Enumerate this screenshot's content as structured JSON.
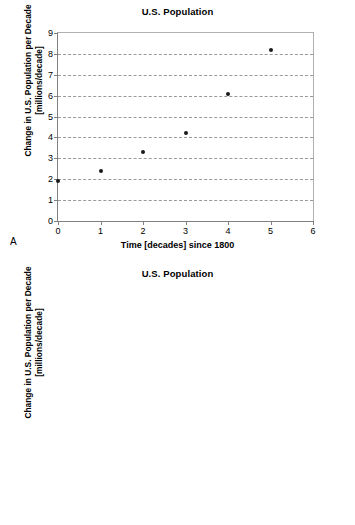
{
  "panels": [
    {
      "letter": "A",
      "title": "U.S. Population",
      "xlabel": "Time [decades] since 1800",
      "ylabel_line1": "Change in U.S. Population per Decade",
      "ylabel_line2": "[millions/decade]"
    },
    {
      "letter": "B",
      "title": "U.S. Population",
      "xlabel": "U.S. Population [millions]",
      "ylabel_line1": "Change in U.S. Population per Decade",
      "ylabel_line2": "[millions/decade]"
    }
  ],
  "chart_data": [
    {
      "type": "scatter",
      "panel": "A",
      "title": "U.S. Population",
      "xlabel": "Time [decades] since 1800",
      "ylabel": "Change in U.S. Population per Decade [millions/decade]",
      "xlim": [
        0,
        6
      ],
      "ylim": [
        0,
        9
      ],
      "xticks": [
        0,
        1,
        2,
        3,
        4,
        5,
        6
      ],
      "yticks": [
        0,
        1,
        2,
        3,
        4,
        5,
        6,
        7,
        8,
        9
      ],
      "grid": "horizontal-dashed",
      "legend": "none",
      "marker_color": "#1a1a1a",
      "x": [
        0,
        1,
        2,
        3,
        4,
        5
      ],
      "y": [
        1.9,
        2.4,
        3.3,
        4.2,
        6.1,
        8.2
      ]
    },
    {
      "type": "scatter",
      "panel": "B",
      "title": "U.S. Population",
      "xlabel": "U.S. Population [millions]",
      "ylabel": "Change in U.S. Population per Decade [millions/decade]",
      "xlim": [
        0,
        25
      ],
      "ylim": [
        0,
        9
      ],
      "xticks": [
        0,
        5,
        10,
        15,
        20,
        25
      ],
      "yticks": [
        0,
        1,
        2,
        3,
        4,
        5,
        6,
        7,
        8,
        9
      ],
      "grid": "horizontal-dashed",
      "legend": "none",
      "marker_color": "#1a1a1a",
      "x": [
        5.3,
        7.2,
        9.6,
        12.9,
        17.1,
        23.2
      ],
      "y": [
        1.9,
        2.4,
        3.35,
        4.2,
        6.1,
        8.2
      ]
    }
  ]
}
